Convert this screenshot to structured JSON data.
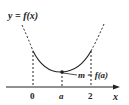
{
  "diagram": {
    "title_label": "y = f(x)",
    "x_axis_label": "x",
    "tick_labels": [
      "0",
      "a",
      "2"
    ],
    "point_label": "m = f(a)",
    "curve": "parabola opening upward, minimum at x = a",
    "colors": {
      "ink": "#222222",
      "background": "#ffffff"
    }
  }
}
